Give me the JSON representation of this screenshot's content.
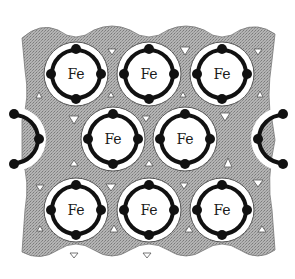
{
  "figure": {
    "type": "crystal-lattice-diagram",
    "atom_label": "Fe",
    "colors": {
      "matrix": "#a9a9a9",
      "matrix_dark": "#8f8f8f",
      "ring": "#111111",
      "shell": "#ffffff",
      "void_triangle": "#ffffff"
    },
    "atoms": [
      {
        "row": 1,
        "col": 1,
        "label": "Fe"
      },
      {
        "row": 1,
        "col": 2,
        "label": "Fe"
      },
      {
        "row": 1,
        "col": 3,
        "label": "Fe"
      },
      {
        "row": 2,
        "col": 1,
        "label": "Fe"
      },
      {
        "row": 2,
        "col": 2,
        "label": "Fe"
      },
      {
        "row": 3,
        "col": 1,
        "label": "Fe"
      },
      {
        "row": 3,
        "col": 2,
        "label": "Fe"
      },
      {
        "row": 3,
        "col": 3,
        "label": "Fe"
      }
    ],
    "partial_atoms": [
      "left-edge",
      "right-edge"
    ],
    "caption": ""
  }
}
